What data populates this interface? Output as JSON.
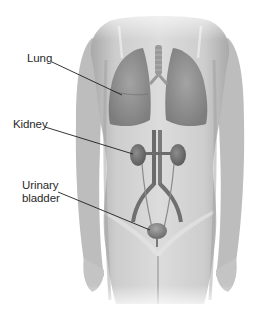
{
  "figure": {
    "type": "anatomical-illustration",
    "colors": {
      "background": "#ffffff",
      "skin": "#cfcfcf",
      "skin_shadow": "#9a9a9a",
      "organ": "#7d7d7d",
      "organ_dark": "#5a5a5a",
      "leader_line": "#1e1e1e",
      "label_text": "#2a2a2a"
    }
  },
  "labels": [
    {
      "id": "lung",
      "line1": "Lung",
      "line2": ""
    },
    {
      "id": "kidney",
      "line1": "Kidney",
      "line2": ""
    },
    {
      "id": "urinary-bladder",
      "line1": "Urinary",
      "line2": "bladder"
    }
  ]
}
